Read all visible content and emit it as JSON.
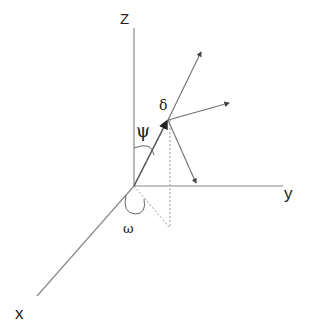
{
  "diagram": {
    "type": "3d-coordinate-vector",
    "axes": {
      "z_label": "Z",
      "y_label": "y",
      "x_label": "x"
    },
    "angles": {
      "psi_label": "ψ",
      "omega_label": "ω",
      "delta_label": "δ"
    },
    "colors": {
      "axis": "#8a8a8a",
      "vector": "#707070",
      "text": "#222222"
    }
  }
}
